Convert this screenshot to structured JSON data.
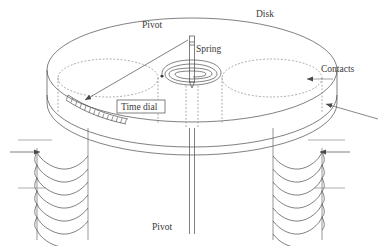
{
  "figure": {
    "kind": "induction-disk-relay-diagram",
    "background": "#ffffff",
    "line_color": "#4a4a4a",
    "dotted_color": "#8a8a8a",
    "label_color": "#3a3a3a"
  },
  "labels": {
    "pivot_top": "Pivot",
    "spring": "Spring",
    "disk": "Disk",
    "contacts": "Contacts",
    "time_dial": "Time dial",
    "pivot_bottom": "Pivot"
  },
  "parts": {
    "disk": {
      "name": "Disk",
      "center_x": 192,
      "center_y": 70,
      "radius_x": 145,
      "radius_y": 52,
      "rim_thickness": 62
    },
    "pole_circles": [
      {
        "name": "left-pole-core",
        "cx": 108,
        "cy": 78,
        "rx": 50,
        "ry": 19
      },
      {
        "name": "right-pole-core",
        "cx": 272,
        "cy": 78,
        "rx": 50,
        "ry": 19
      }
    ],
    "shaft": {
      "name": "pivot-shaft",
      "x": 192,
      "top_y": 35,
      "bottom_y": 238,
      "width": 5
    },
    "spring": {
      "name": "spiral-spring",
      "cx": 192,
      "cy": 77,
      "turns": 4
    },
    "time_dial": {
      "name": "time-dial-scale",
      "teeth": 14
    },
    "coils": [
      {
        "name": "left-coil",
        "cx": 60,
        "turns": 6
      },
      {
        "name": "right-coil",
        "cx": 296,
        "turns": 6
      }
    ],
    "arrows": [
      {
        "name": "contacts-arrow",
        "direction": "left"
      },
      {
        "name": "lower-right-arrow",
        "direction": "upper-left"
      },
      {
        "name": "left-coil-arrow",
        "direction": "right"
      },
      {
        "name": "right-coil-arrow",
        "direction": "left"
      },
      {
        "name": "time-dial-pointer",
        "direction": "lower-left"
      }
    ]
  }
}
